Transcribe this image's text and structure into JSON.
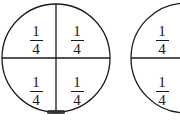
{
  "figure": {
    "background_color": "#ffffff",
    "stroke_color": "#1a1a1a",
    "text_color": "#1a1a1a",
    "width": 180,
    "height": 120
  },
  "circles": [
    {
      "id": "circle-one",
      "label": "whole circle divided into four quarters",
      "center_x": 56,
      "center_y": 58,
      "radius": 54,
      "clipped": false,
      "has_vertical_diameter": true,
      "has_horizontal_diameter": true,
      "parts": [
        {
          "id": "upper-left",
          "numerator": "1",
          "denominator": "4",
          "x": 36,
          "y": 33
        },
        {
          "id": "upper-right",
          "numerator": "1",
          "denominator": "4",
          "x": 77,
          "y": 33
        },
        {
          "id": "lower-left",
          "numerator": "1",
          "denominator": "4",
          "x": 36,
          "y": 84
        },
        {
          "id": "lower-right",
          "numerator": "1",
          "denominator": "4",
          "x": 77,
          "y": 84
        }
      ]
    },
    {
      "id": "circle-two",
      "label": "second circle cut off at right edge",
      "center_x": 186,
      "center_y": 58,
      "radius": 55,
      "clipped": true,
      "has_vertical_diameter": false,
      "has_horizontal_diameter": true,
      "parts": [
        {
          "id": "upper",
          "numerator": "1",
          "denominator": "4",
          "x": 162,
          "y": 33
        },
        {
          "id": "lower",
          "numerator": "1",
          "denominator": "4",
          "x": 162,
          "y": 84
        }
      ]
    }
  ],
  "artifacts": [
    {
      "id": "bottom-smudge",
      "x": 56,
      "y": 112,
      "width": 18,
      "height": 4
    }
  ]
}
